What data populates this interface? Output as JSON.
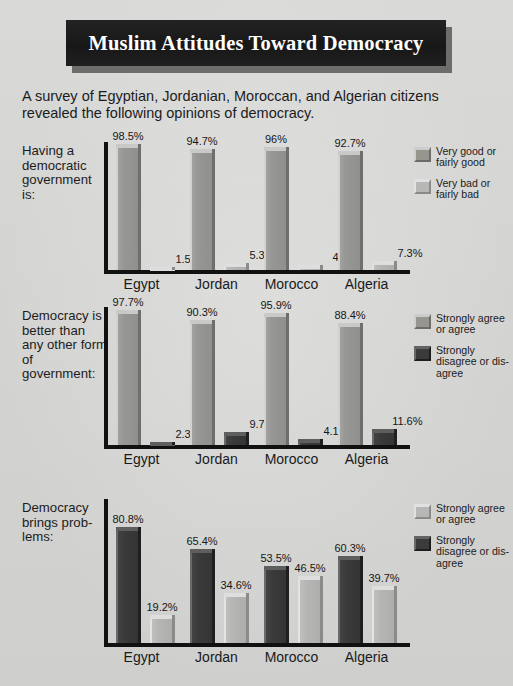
{
  "header": {
    "title": "Muslim Attitudes Toward Democracy",
    "subtitle": "A survey of Egyptian, Jordanian, Moroccan, and Algerian citizens revealed the following opinions of democracy."
  },
  "chart_data": [
    {
      "type": "bar",
      "title": "Having a democratic government is:",
      "panel_label": "Having a democratic government is:",
      "categories": [
        "Egypt",
        "Jordan",
        "Morocco",
        "Algeria"
      ],
      "xlabel": "",
      "ylabel": "",
      "ylim": [
        0,
        100
      ],
      "grid": false,
      "legend_position": "right",
      "series": [
        {
          "name": "Very good or fairly good",
          "style": "mid",
          "values": [
            98.5,
            94.7,
            96,
            92.7
          ],
          "labels": [
            "98.5%",
            "94.7%",
            "96%",
            "92.7%"
          ]
        },
        {
          "name": "Very bad or fairly bad",
          "style": "light",
          "values": [
            1.5,
            5.3,
            4,
            7.3
          ],
          "labels": [
            "1.5%",
            "5.3%",
            "4%",
            "7.3%"
          ]
        }
      ],
      "legend": [
        {
          "label": "Very good or fairly good",
          "style": "mid"
        },
        {
          "label": "Very bad or fairly bad",
          "style": "light"
        }
      ]
    },
    {
      "type": "bar",
      "title": "Democracy is better than any other form of government:",
      "panel_label": "Democracy is better than any other form of government:",
      "categories": [
        "Egypt",
        "Jordan",
        "Morocco",
        "Algeria"
      ],
      "xlabel": "",
      "ylabel": "",
      "ylim": [
        0,
        100
      ],
      "grid": false,
      "legend_position": "right",
      "series": [
        {
          "name": "Strongly agree or agree",
          "style": "mid",
          "values": [
            97.7,
            90.3,
            95.9,
            88.4
          ],
          "labels": [
            "97.7%",
            "90.3%",
            "95.9%",
            "88.4%"
          ]
        },
        {
          "name": "Strongly disagree or disagree",
          "style": "dark",
          "values": [
            2.3,
            9.7,
            4.1,
            11.6
          ],
          "labels": [
            "2.3%",
            "9.7%",
            "4.1%",
            "11.6%"
          ]
        }
      ],
      "legend": [
        {
          "label": "Strongly agree or agree",
          "style": "mid"
        },
        {
          "label": "Strongly disagree or dis-agree",
          "style": "dark"
        }
      ]
    },
    {
      "type": "bar",
      "title": "Democracy brings problems:",
      "panel_label": "Democracy brings prob-lems:",
      "categories": [
        "Egypt",
        "Jordan",
        "Morocco",
        "Algeria"
      ],
      "xlabel": "",
      "ylabel": "",
      "ylim": [
        0,
        100
      ],
      "grid": false,
      "legend_position": "right",
      "series": [
        {
          "name": "Strongly disagree or disagree",
          "style": "dark",
          "values": [
            80.8,
            65.4,
            53.5,
            60.3
          ],
          "labels": [
            "80.8%",
            "65.4%",
            "53.5%",
            "60.3%"
          ]
        },
        {
          "name": "Strongly agree or agree",
          "style": "light",
          "values": [
            19.2,
            34.6,
            46.5,
            39.7
          ],
          "labels": [
            "19.2%",
            "34.6%",
            "46.5%",
            "39.7%"
          ]
        }
      ],
      "legend": [
        {
          "label": "Strongly agree or agree",
          "style": "light"
        },
        {
          "label": "Strongly disagree or dis-agree",
          "style": "dark"
        }
      ]
    }
  ]
}
